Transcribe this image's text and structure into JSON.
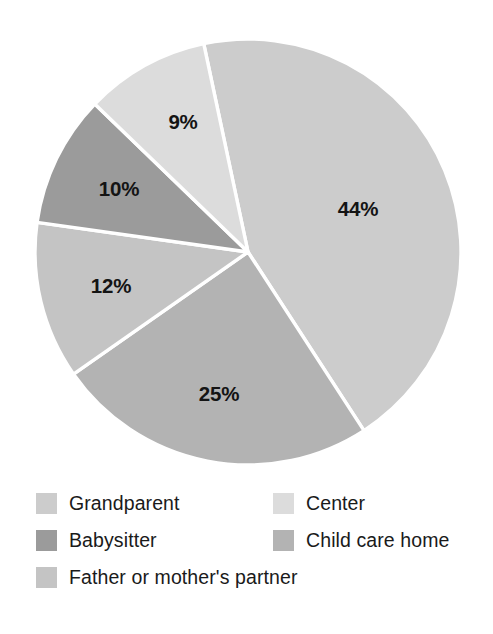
{
  "chart_data": {
    "type": "pie",
    "title": "",
    "subtitle": "",
    "xlabel": "",
    "ylabel": "",
    "grid": false,
    "legend_position": "bottom",
    "units": "percent",
    "center": {
      "x": 248,
      "y": 252
    },
    "radius": 213,
    "start_angle_deg": -12,
    "direction": "clockwise",
    "categories": [
      "Grandparent",
      "Child care home",
      "Father or mother's partner",
      "Babysitter",
      "Center"
    ],
    "values": [
      44,
      25,
      12,
      10,
      9
    ],
    "labels": [
      "44%",
      "25%",
      "12%",
      "10%",
      "9%"
    ],
    "slices": [
      {
        "name": "Grandparent",
        "value": 44,
        "label": "44%",
        "color": "#cccccc",
        "start_deg": -12,
        "end_deg": 147,
        "label_x": 358,
        "label_y": 211
      },
      {
        "name": "Child care home",
        "value": 25,
        "label": "25%",
        "color": "#b3b3b3",
        "start_deg": 147,
        "end_deg": 235,
        "label_x": 219,
        "label_y": 396
      },
      {
        "name": "Father or mother's partner",
        "value": 12,
        "label": "12%",
        "color": "#c4c4c4",
        "start_deg": 235,
        "end_deg": 278,
        "label_x": 111,
        "label_y": 288
      },
      {
        "name": "Babysitter",
        "value": 10,
        "label": "10%",
        "color": "#9b9b9b",
        "start_deg": 278,
        "end_deg": 314,
        "label_x": 119,
        "label_y": 191
      },
      {
        "name": "Center",
        "value": 9,
        "label": "9%",
        "color": "#dcdcdc",
        "start_deg": 314,
        "end_deg": 348,
        "label_x": 183,
        "label_y": 124
      }
    ],
    "legend": [
      {
        "label": "Grandparent",
        "color": "#cccccc",
        "row": 0,
        "col": 0
      },
      {
        "label": "Babysitter",
        "color": "#9b9b9b",
        "row": 1,
        "col": 0
      },
      {
        "label": "Father or mother's partner",
        "color": "#c4c4c4",
        "row": 2,
        "col": 0
      },
      {
        "label": "Center",
        "color": "#dcdcdc",
        "row": 0,
        "col": 1
      },
      {
        "label": "Child care home",
        "color": "#b3b3b3",
        "row": 1,
        "col": 1
      }
    ]
  },
  "colors": {
    "background": "#ffffff",
    "slice_border": "#ffffff",
    "label_text": "#141414",
    "legend_text": "#1a1a1a"
  }
}
